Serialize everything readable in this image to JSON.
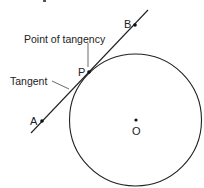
{
  "diagram": {
    "labels": {
      "point_b": "B",
      "point_p": "P",
      "point_a": "A",
      "center_o": "O",
      "point_of_tangency": "Point of tangency",
      "tangent": "Tangent"
    },
    "colors": {
      "stroke": "#222222",
      "background": "#ffffff"
    },
    "geometry": {
      "circle": {
        "cx": 135.5,
        "cy": 120,
        "r": 66
      },
      "tangent_line": {
        "x1": 31,
        "y1": 133,
        "x2": 148,
        "y2": 10
      },
      "points": {
        "B": {
          "x": 135,
          "y": 25
        },
        "P": {
          "x": 89,
          "y": 72
        },
        "A": {
          "x": 42,
          "y": 121
        },
        "O": {
          "x": 136,
          "y": 120
        }
      }
    }
  }
}
